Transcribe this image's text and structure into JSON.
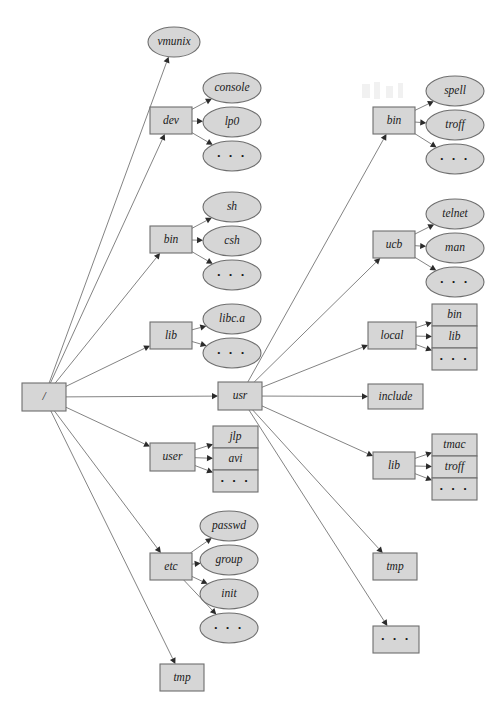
{
  "diagram": {
    "colors": {
      "node_fill": "#d6d6d6",
      "node_stroke": "#6e6e6e",
      "edge_stroke": "#6d6d6d",
      "arrow_fill": "#2b2b2b",
      "background": "#ffffff",
      "label_text": "#1a1a1a"
    },
    "root": {
      "id": "root",
      "label": "/",
      "shape": "rect",
      "x": 22,
      "y": 383,
      "w": 44,
      "h": 28
    },
    "nodes": [
      {
        "id": "vmunix",
        "label": "vmunix",
        "shape": "ellipse",
        "x": 148,
        "y": 27,
        "w": 52,
        "h": 30
      },
      {
        "id": "dev",
        "label": "dev",
        "shape": "rect",
        "x": 150,
        "y": 107,
        "w": 42,
        "h": 27
      },
      {
        "id": "dev-console",
        "label": "console",
        "shape": "ellipse",
        "x": 203,
        "y": 73,
        "w": 58,
        "h": 30
      },
      {
        "id": "dev-lp0",
        "label": "lp0",
        "shape": "ellipse",
        "x": 203,
        "y": 107,
        "w": 58,
        "h": 30
      },
      {
        "id": "dev-dots",
        "label": "· · ·",
        "shape": "ellipse",
        "x": 203,
        "y": 141,
        "w": 58,
        "h": 30
      },
      {
        "id": "bin",
        "label": "bin",
        "shape": "rect",
        "x": 150,
        "y": 226,
        "w": 42,
        "h": 27
      },
      {
        "id": "bin-sh",
        "label": "sh",
        "shape": "ellipse",
        "x": 203,
        "y": 192,
        "w": 58,
        "h": 30
      },
      {
        "id": "bin-csh",
        "label": "csh",
        "shape": "ellipse",
        "x": 203,
        "y": 226,
        "w": 58,
        "h": 30
      },
      {
        "id": "bin-dots",
        "label": "· · ·",
        "shape": "ellipse",
        "x": 203,
        "y": 260,
        "w": 58,
        "h": 30
      },
      {
        "id": "lib",
        "label": "lib",
        "shape": "rect",
        "x": 150,
        "y": 322,
        "w": 42,
        "h": 27
      },
      {
        "id": "lib-libca",
        "label": "libc.a",
        "shape": "ellipse",
        "x": 203,
        "y": 304,
        "w": 58,
        "h": 30
      },
      {
        "id": "lib-dots",
        "label": "· · ·",
        "shape": "ellipse",
        "x": 203,
        "y": 338,
        "w": 58,
        "h": 30
      },
      {
        "id": "usr",
        "label": "usr",
        "shape": "rect",
        "x": 218,
        "y": 382,
        "w": 44,
        "h": 28
      },
      {
        "id": "user",
        "label": "user",
        "shape": "rect",
        "x": 150,
        "y": 443,
        "w": 45,
        "h": 28
      },
      {
        "id": "user-jlp",
        "label": "jlp",
        "shape": "rect",
        "x": 213,
        "y": 426,
        "w": 45,
        "h": 22
      },
      {
        "id": "user-avi",
        "label": "avi",
        "shape": "rect",
        "x": 213,
        "y": 448,
        "w": 45,
        "h": 22
      },
      {
        "id": "user-dots",
        "label": "· · ·",
        "shape": "rect",
        "x": 213,
        "y": 470,
        "w": 45,
        "h": 22
      },
      {
        "id": "etc",
        "label": "etc",
        "shape": "rect",
        "x": 150,
        "y": 553,
        "w": 42,
        "h": 27
      },
      {
        "id": "etc-passwd",
        "label": "passwd",
        "shape": "ellipse",
        "x": 200,
        "y": 511,
        "w": 58,
        "h": 30
      },
      {
        "id": "etc-group",
        "label": "group",
        "shape": "ellipse",
        "x": 200,
        "y": 545,
        "w": 58,
        "h": 30
      },
      {
        "id": "etc-init",
        "label": "init",
        "shape": "ellipse",
        "x": 200,
        "y": 579,
        "w": 58,
        "h": 30
      },
      {
        "id": "etc-dots",
        "label": "· · ·",
        "shape": "ellipse",
        "x": 200,
        "y": 613,
        "w": 58,
        "h": 30
      },
      {
        "id": "tmp-root",
        "label": "tmp",
        "shape": "rect",
        "x": 160,
        "y": 664,
        "w": 44,
        "h": 27
      },
      {
        "id": "usr-bin",
        "label": "bin",
        "shape": "rect",
        "x": 373,
        "y": 107,
        "w": 42,
        "h": 27
      },
      {
        "id": "usrbin-spell",
        "label": "spell",
        "shape": "ellipse",
        "x": 426,
        "y": 76,
        "w": 58,
        "h": 30
      },
      {
        "id": "usrbin-troff",
        "label": "troff",
        "shape": "ellipse",
        "x": 426,
        "y": 110,
        "w": 58,
        "h": 30
      },
      {
        "id": "usrbin-dots",
        "label": "· · ·",
        "shape": "ellipse",
        "x": 426,
        "y": 144,
        "w": 58,
        "h": 30
      },
      {
        "id": "usr-ucb",
        "label": "ucb",
        "shape": "rect",
        "x": 373,
        "y": 231,
        "w": 42,
        "h": 27
      },
      {
        "id": "ucb-telnet",
        "label": "telnet",
        "shape": "ellipse",
        "x": 426,
        "y": 199,
        "w": 58,
        "h": 30
      },
      {
        "id": "ucb-man",
        "label": "man",
        "shape": "ellipse",
        "x": 426,
        "y": 233,
        "w": 58,
        "h": 30
      },
      {
        "id": "ucb-dots",
        "label": "· · ·",
        "shape": "ellipse",
        "x": 426,
        "y": 267,
        "w": 58,
        "h": 30
      },
      {
        "id": "usr-local",
        "label": "local",
        "shape": "rect",
        "x": 368,
        "y": 322,
        "w": 48,
        "h": 27
      },
      {
        "id": "local-bin",
        "label": "bin",
        "shape": "rect",
        "x": 432,
        "y": 304,
        "w": 45,
        "h": 22
      },
      {
        "id": "local-lib",
        "label": "lib",
        "shape": "rect",
        "x": 432,
        "y": 326,
        "w": 45,
        "h": 22
      },
      {
        "id": "local-dots",
        "label": "· · ·",
        "shape": "rect",
        "x": 432,
        "y": 348,
        "w": 45,
        "h": 22
      },
      {
        "id": "usr-include",
        "label": "include",
        "shape": "rect",
        "x": 368,
        "y": 384,
        "w": 55,
        "h": 25
      },
      {
        "id": "usr-lib",
        "label": "lib",
        "shape": "rect",
        "x": 373,
        "y": 452,
        "w": 42,
        "h": 27
      },
      {
        "id": "usrlib-tmac",
        "label": "tmac",
        "shape": "rect",
        "x": 432,
        "y": 434,
        "w": 45,
        "h": 22
      },
      {
        "id": "usrlib-troff",
        "label": "troff",
        "shape": "rect",
        "x": 432,
        "y": 456,
        "w": 45,
        "h": 22
      },
      {
        "id": "usrlib-dots",
        "label": "· · ·",
        "shape": "rect",
        "x": 432,
        "y": 478,
        "w": 45,
        "h": 22
      },
      {
        "id": "usr-tmp",
        "label": "tmp",
        "shape": "rect",
        "x": 373,
        "y": 553,
        "w": 44,
        "h": 27
      },
      {
        "id": "usr-dots",
        "label": "· · ·",
        "shape": "rect",
        "x": 373,
        "y": 626,
        "w": 46,
        "h": 27
      }
    ],
    "edges": [
      {
        "from": "root",
        "to": "vmunix"
      },
      {
        "from": "root",
        "to": "dev"
      },
      {
        "from": "root",
        "to": "bin"
      },
      {
        "from": "root",
        "to": "lib"
      },
      {
        "from": "root",
        "to": "usr"
      },
      {
        "from": "root",
        "to": "user"
      },
      {
        "from": "root",
        "to": "etc"
      },
      {
        "from": "root",
        "to": "tmp-root"
      },
      {
        "from": "dev",
        "to": "dev-console"
      },
      {
        "from": "dev",
        "to": "dev-lp0"
      },
      {
        "from": "dev",
        "to": "dev-dots"
      },
      {
        "from": "bin",
        "to": "bin-sh"
      },
      {
        "from": "bin",
        "to": "bin-csh"
      },
      {
        "from": "bin",
        "to": "bin-dots"
      },
      {
        "from": "lib",
        "to": "lib-libca"
      },
      {
        "from": "lib",
        "to": "lib-dots"
      },
      {
        "from": "user",
        "to": "user-jlp"
      },
      {
        "from": "user",
        "to": "user-avi"
      },
      {
        "from": "user",
        "to": "user-dots"
      },
      {
        "from": "etc",
        "to": "etc-passwd"
      },
      {
        "from": "etc",
        "to": "etc-group"
      },
      {
        "from": "etc",
        "to": "etc-init"
      },
      {
        "from": "etc",
        "to": "etc-dots"
      },
      {
        "from": "usr",
        "to": "usr-bin"
      },
      {
        "from": "usr",
        "to": "usr-ucb"
      },
      {
        "from": "usr",
        "to": "usr-local"
      },
      {
        "from": "usr",
        "to": "usr-include"
      },
      {
        "from": "usr",
        "to": "usr-lib"
      },
      {
        "from": "usr",
        "to": "usr-tmp"
      },
      {
        "from": "usr",
        "to": "usr-dots"
      },
      {
        "from": "usr-bin",
        "to": "usrbin-spell"
      },
      {
        "from": "usr-bin",
        "to": "usrbin-troff"
      },
      {
        "from": "usr-bin",
        "to": "usrbin-dots"
      },
      {
        "from": "usr-ucb",
        "to": "ucb-telnet"
      },
      {
        "from": "usr-ucb",
        "to": "ucb-man"
      },
      {
        "from": "usr-ucb",
        "to": "ucb-dots"
      },
      {
        "from": "usr-local",
        "to": "local-bin"
      },
      {
        "from": "usr-local",
        "to": "local-lib"
      },
      {
        "from": "usr-local",
        "to": "local-dots"
      },
      {
        "from": "usr-lib",
        "to": "usrlib-tmac"
      },
      {
        "from": "usr-lib",
        "to": "usrlib-troff"
      },
      {
        "from": "usr-lib",
        "to": "usrlib-dots"
      }
    ]
  }
}
